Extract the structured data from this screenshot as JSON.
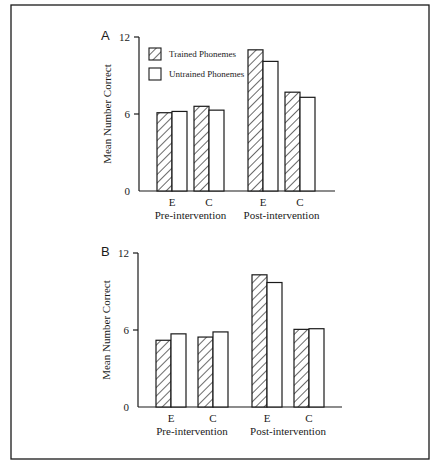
{
  "chart_data": [
    {
      "panel": "A",
      "type": "bar",
      "title": "",
      "ylabel": "Mean Number Correct",
      "xlabel": "",
      "ylim": [
        0,
        12
      ],
      "yticks": [
        0,
        6,
        12
      ],
      "grid": false,
      "legend_position": "upper-left (inside plot)",
      "groups": [
        "Pre-intervention",
        "Post-intervention"
      ],
      "categories": [
        "E",
        "C",
        "E",
        "C"
      ],
      "category_groups": [
        "Pre-intervention",
        "Pre-intervention",
        "Post-intervention",
        "Post-intervention"
      ],
      "series": [
        {
          "name": "Trained Phonemes",
          "pattern": "hatched",
          "values": [
            6.1,
            6.6,
            11.0,
            7.7
          ]
        },
        {
          "name": "Untrained Phonemes",
          "pattern": "open",
          "values": [
            6.2,
            6.3,
            10.1,
            7.3
          ]
        }
      ]
    },
    {
      "panel": "B",
      "type": "bar",
      "title": "",
      "ylabel": "Mean Number Correct",
      "xlabel": "",
      "ylim": [
        0,
        12
      ],
      "yticks": [
        0,
        6,
        12
      ],
      "grid": false,
      "legend_position": "none (shared with panel A)",
      "groups": [
        "Pre-intervention",
        "Post-intervention"
      ],
      "categories": [
        "E",
        "C",
        "E",
        "C"
      ],
      "category_groups": [
        "Pre-intervention",
        "Pre-intervention",
        "Post-intervention",
        "Post-intervention"
      ],
      "series": [
        {
          "name": "Trained Phonemes",
          "pattern": "hatched",
          "values": [
            5.2,
            5.45,
            10.3,
            6.05
          ]
        },
        {
          "name": "Untrained Phonemes",
          "pattern": "open",
          "values": [
            5.7,
            5.85,
            9.7,
            6.1
          ]
        }
      ]
    }
  ],
  "legend": {
    "items": [
      {
        "label": "Trained Phonemes",
        "pattern": "hatched"
      },
      {
        "label": "Untrained Phonemes",
        "pattern": "open"
      }
    ]
  },
  "colors": {
    "ink": "#1a1a1a",
    "background": "#ffffff"
  }
}
